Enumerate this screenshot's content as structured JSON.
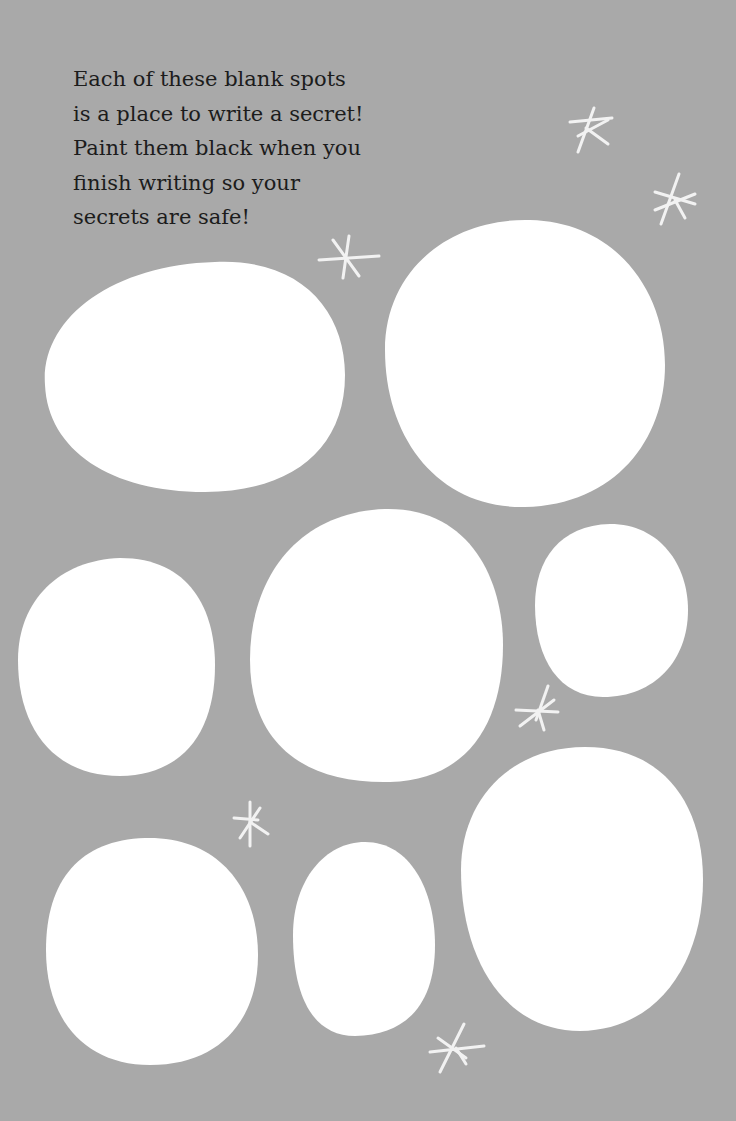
{
  "page": {
    "background_color": "#a9a9a9",
    "spot_color": "#ffffff",
    "text_color": "#1c1c1c"
  },
  "instructions": {
    "lines": [
      "Each of these blank spots",
      "is a place to write a secret!",
      "Paint them black when you",
      "finish writing so your",
      "secrets are safe!"
    ]
  },
  "spots": [
    {
      "name": "secret-spot-1",
      "label": "blank spot 1"
    },
    {
      "name": "secret-spot-2",
      "label": "blank spot 2"
    },
    {
      "name": "secret-spot-3",
      "label": "blank spot 3"
    },
    {
      "name": "secret-spot-4",
      "label": "blank spot 4"
    },
    {
      "name": "secret-spot-5",
      "label": "blank spot 5"
    },
    {
      "name": "secret-spot-6",
      "label": "blank spot 6"
    },
    {
      "name": "secret-spot-7",
      "label": "blank spot 7"
    },
    {
      "name": "secret-spot-8",
      "label": "blank spot 8"
    }
  ],
  "decorations": {
    "star_icon": "asterisk-sparkle",
    "star_count": 6
  }
}
